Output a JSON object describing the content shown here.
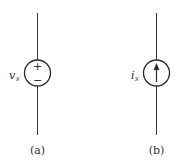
{
  "diagram": {
    "title": "",
    "elements": [
      {
        "id": "a",
        "type": "independent-voltage-source",
        "symbol": {
          "var": "v",
          "sub": "s"
        },
        "polarity": {
          "top": "+",
          "bottom": "−"
        },
        "caption": "(a)"
      },
      {
        "id": "b",
        "type": "independent-current-source",
        "symbol": {
          "var": "i",
          "sub": "s"
        },
        "arrow_direction": "up",
        "caption": "(b)"
      }
    ]
  },
  "colors": {
    "wire": "#3a3a3a",
    "outline": "#2a2a2a",
    "text": "#333333",
    "background": "#ffffff"
  }
}
